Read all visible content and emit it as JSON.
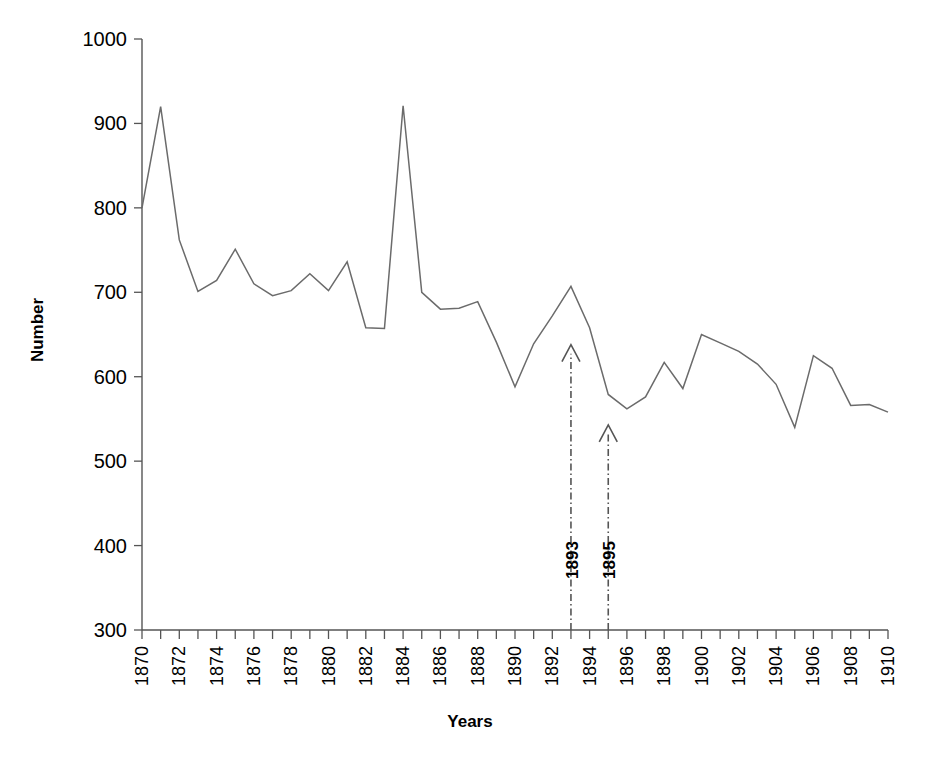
{
  "chart_data": {
    "type": "line",
    "title": "",
    "xlabel": "Years",
    "ylabel": "Number",
    "xlim": [
      1870,
      1910
    ],
    "ylim": [
      300,
      1000
    ],
    "ytick_values": [
      300,
      400,
      500,
      600,
      700,
      800,
      900,
      1000
    ],
    "ytick_labels": [
      "300",
      "400",
      "500",
      "600",
      "700",
      "800",
      "900",
      "1000"
    ],
    "xtick_values": [
      1870,
      1871,
      1872,
      1873,
      1874,
      1875,
      1876,
      1877,
      1878,
      1879,
      1880,
      1881,
      1882,
      1883,
      1884,
      1885,
      1886,
      1887,
      1888,
      1889,
      1890,
      1891,
      1892,
      1893,
      1894,
      1895,
      1896,
      1897,
      1898,
      1899,
      1900,
      1901,
      1902,
      1903,
      1904,
      1905,
      1906,
      1907,
      1908,
      1909,
      1910
    ],
    "xtick_labels": [
      "1870",
      "",
      "1872",
      "",
      "1874",
      "",
      "1876",
      "",
      "1878",
      "",
      "1880",
      "",
      "1882",
      "",
      "1884",
      "",
      "1886",
      "",
      "1888",
      "",
      "1890",
      "",
      "1892",
      "",
      "1894",
      "",
      "1896",
      "",
      "1898",
      "",
      "1900",
      "",
      "1902",
      "",
      "1904",
      "",
      "1906",
      "",
      "1908",
      "",
      "1910"
    ],
    "grid": false,
    "legend": null,
    "x": [
      1870,
      1871,
      1872,
      1873,
      1874,
      1875,
      1876,
      1877,
      1878,
      1879,
      1880,
      1881,
      1882,
      1883,
      1884,
      1885,
      1886,
      1887,
      1888,
      1889,
      1890,
      1891,
      1892,
      1893,
      1894,
      1895,
      1896,
      1897,
      1898,
      1899,
      1900,
      1901,
      1902,
      1903,
      1904,
      1905,
      1906,
      1907,
      1908,
      1909,
      1910
    ],
    "values": [
      800,
      920,
      762,
      701,
      714,
      751,
      710,
      696,
      702,
      722,
      702,
      736,
      658,
      657,
      921,
      700,
      680,
      681,
      689,
      641,
      588,
      639,
      672,
      707,
      658,
      579,
      562,
      576,
      617,
      586,
      650,
      640,
      630,
      615,
      591,
      540,
      625,
      610,
      566,
      567,
      558
    ],
    "series": [
      {
        "name": "Number",
        "values": [
          800,
          920,
          762,
          701,
          714,
          751,
          710,
          696,
          702,
          722,
          702,
          736,
          658,
          657,
          921,
          700,
          680,
          681,
          689,
          641,
          588,
          639,
          672,
          707,
          658,
          579,
          562,
          576,
          617,
          586,
          650,
          640,
          630,
          615,
          591,
          540,
          625,
          610,
          566,
          567,
          558
        ]
      }
    ],
    "annotations": [
      {
        "label": "1893",
        "x": 1893,
        "tip_value": 638,
        "orientation": "vertical-arrow-up"
      },
      {
        "label": "1895",
        "x": 1895,
        "tip_value": 543,
        "orientation": "vertical-arrow-up"
      }
    ]
  }
}
